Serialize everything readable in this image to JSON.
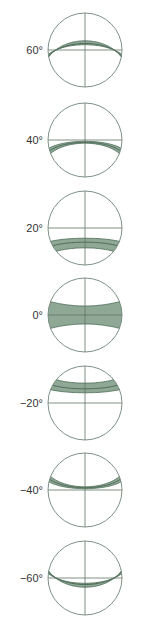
{
  "diagram": {
    "colors": {
      "band_fill": "#8fa896",
      "band_stroke": "#4d6b57",
      "circle_stroke": "#6f8577",
      "axis_stroke": "#5f7566",
      "label": "#333333"
    },
    "panels": [
      {
        "label": "60°",
        "latitude": 60,
        "cy": 50
      },
      {
        "label": "40°",
        "latitude": 40,
        "cy": 140
      },
      {
        "label": "20°",
        "latitude": 20,
        "cy": 228
      },
      {
        "label": "0°",
        "latitude": 0,
        "cy": 315
      },
      {
        "label": "−20°",
        "latitude": -20,
        "cy": 403
      },
      {
        "label": "−40°",
        "latitude": -40,
        "cy": 490
      },
      {
        "label": "−60°",
        "latitude": -60,
        "cy": 578
      }
    ]
  }
}
